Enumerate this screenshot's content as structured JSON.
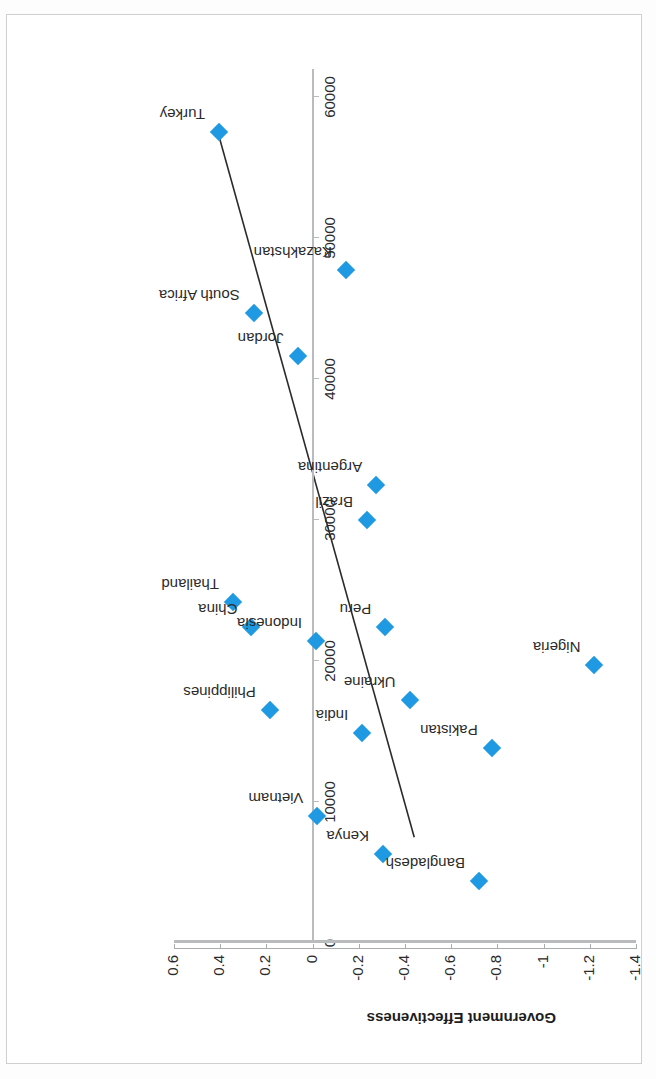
{
  "chart_data": {
    "type": "scatter",
    "title": "",
    "xlabel": "GDP per person employed (constant 2011 PPP $)",
    "ylabel": "Government Effectiveness",
    "xlim": [
      0,
      62000
    ],
    "ylim": [
      -1.4,
      0.6
    ],
    "x_ticks": [
      0,
      10000,
      20000,
      30000,
      40000,
      50000,
      60000
    ],
    "x_tick_labels": [
      "0",
      "10000",
      "20000",
      "30000",
      "40000",
      "50000",
      "60000"
    ],
    "y_ticks": [
      0.6,
      0.4,
      0.2,
      0,
      -0.2,
      -0.4,
      -0.6,
      -0.8,
      -1,
      -1.2,
      -1.4
    ],
    "y_tick_labels": [
      "0.6",
      "0.4",
      "0.2",
      "0",
      "-0.2",
      "-0.4",
      "-0.6",
      "-0.8",
      "-1",
      "-1.2",
      "-1.4"
    ],
    "grid": false,
    "legend": false,
    "marker_color": "#1f9ae2",
    "marker_shape": "diamond",
    "trendline": {
      "visible": true,
      "color": "#2b2b2b",
      "x_start": 57500,
      "y_start": 0.41,
      "x_end": 7500,
      "y_end": -0.44
    },
    "points": [
      {
        "label": "Turkey",
        "x": 57500,
        "y": 0.405
      },
      {
        "label": "South Africa",
        "x": 44700,
        "y": 0.255
      },
      {
        "label": "Jordan",
        "x": 41600,
        "y": 0.065
      },
      {
        "label": "Kazakhstan",
        "x": 47700,
        "y": -0.145
      },
      {
        "label": "Thailand",
        "x": 24200,
        "y": 0.345
      },
      {
        "label": "China",
        "x": 22400,
        "y": 0.265
      },
      {
        "label": "Philippines",
        "x": 16500,
        "y": 0.185
      },
      {
        "label": "Indonesia",
        "x": 21400,
        "y": -0.015
      },
      {
        "label": "Brazil",
        "x": 30000,
        "y": -0.235
      },
      {
        "label": "Argentina",
        "x": 32500,
        "y": -0.275
      },
      {
        "label": "Peru",
        "x": 22400,
        "y": -0.315
      },
      {
        "label": "India",
        "x": 14900,
        "y": -0.215
      },
      {
        "label": "Ukraine",
        "x": 17200,
        "y": -0.42
      },
      {
        "label": "Vietnam",
        "x": 9000,
        "y": -0.02
      },
      {
        "label": "Kenya",
        "x": 6300,
        "y": -0.305
      },
      {
        "label": "Bangladesh",
        "x": 4400,
        "y": -0.72
      },
      {
        "label": "Pakistan",
        "x": 13800,
        "y": -0.775
      },
      {
        "label": "Nigeria",
        "x": 19700,
        "y": -1.22
      }
    ]
  }
}
